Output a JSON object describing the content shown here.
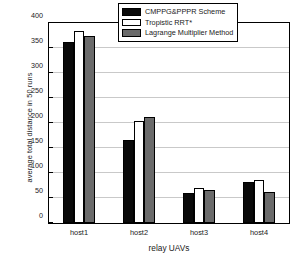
{
  "chart_data": {
    "type": "bar",
    "title": "",
    "xlabel": "relay UAVs",
    "ylabel": "average total distance in 50 runs",
    "categories": [
      "host1",
      "host2",
      "host3",
      "host4"
    ],
    "series": [
      {
        "name": "CMPPG&PPPR Scheme",
        "color": "#0a0a0a",
        "values": [
          363,
          167,
          61,
          82
        ]
      },
      {
        "name": "Tropistic RRT*",
        "color": "#ffffff",
        "values": [
          385,
          205,
          70,
          86
        ]
      },
      {
        "name": "Lagrange Multiplier Method",
        "color": "#6b6b6b",
        "values": [
          375,
          212,
          66,
          62
        ]
      }
    ],
    "ylim": [
      0,
      400
    ],
    "yticks": [
      0,
      50,
      100,
      150,
      200,
      250,
      300,
      350,
      400
    ],
    "yticklabels": [
      "0",
      "50",
      "100",
      "150",
      "200",
      "250",
      "300",
      "350",
      "400"
    ],
    "grid": "horizontal",
    "legend_position": "top-right-inside",
    "frame": true
  }
}
